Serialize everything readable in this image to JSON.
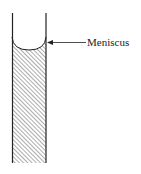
{
  "diagram": {
    "label": "Meniscus",
    "colors": {
      "line": "#222222",
      "hatch": "#555555",
      "background": "#ffffff"
    }
  }
}
